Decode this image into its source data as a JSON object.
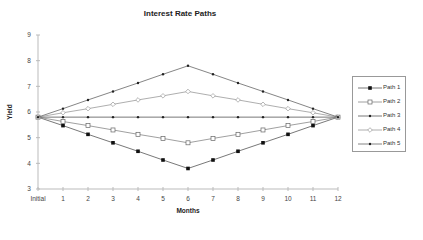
{
  "chart_data": {
    "type": "line",
    "title": "Interest Rate Paths",
    "xlabel": "Months",
    "ylabel": "Yield",
    "categories": [
      "Initial",
      "1",
      "2",
      "3",
      "4",
      "5",
      "6",
      "7",
      "8",
      "9",
      "10",
      "11",
      "12"
    ],
    "ylim": [
      3,
      9
    ],
    "yticks": [
      "3",
      "4",
      "5",
      "6",
      "7",
      "8",
      "9"
    ],
    "grid": false,
    "legend_position": "right",
    "series": [
      {
        "name": "Path 1",
        "marker": "filled-square",
        "values": [
          5.8,
          5.47,
          5.13,
          4.8,
          4.47,
          4.13,
          3.8,
          4.13,
          4.47,
          4.8,
          5.13,
          5.47,
          5.8
        ]
      },
      {
        "name": "Path 2",
        "marker": "open-square",
        "values": [
          5.8,
          5.63,
          5.47,
          5.3,
          5.13,
          4.97,
          4.8,
          4.97,
          5.13,
          5.3,
          5.47,
          5.63,
          5.8
        ]
      },
      {
        "name": "Path 3",
        "marker": "small-dot",
        "values": [
          5.8,
          5.8,
          5.8,
          5.8,
          5.8,
          5.8,
          5.8,
          5.8,
          5.8,
          5.8,
          5.8,
          5.8,
          5.8
        ]
      },
      {
        "name": "Path 4",
        "marker": "open-diamond",
        "values": [
          5.8,
          5.97,
          6.13,
          6.3,
          6.47,
          6.63,
          6.8,
          6.63,
          6.47,
          6.3,
          6.13,
          5.97,
          5.8
        ]
      },
      {
        "name": "Path 5",
        "marker": "small-star",
        "values": [
          5.8,
          6.13,
          6.47,
          6.8,
          7.13,
          7.47,
          7.8,
          7.47,
          7.13,
          6.8,
          6.47,
          6.13,
          5.8
        ]
      }
    ]
  }
}
